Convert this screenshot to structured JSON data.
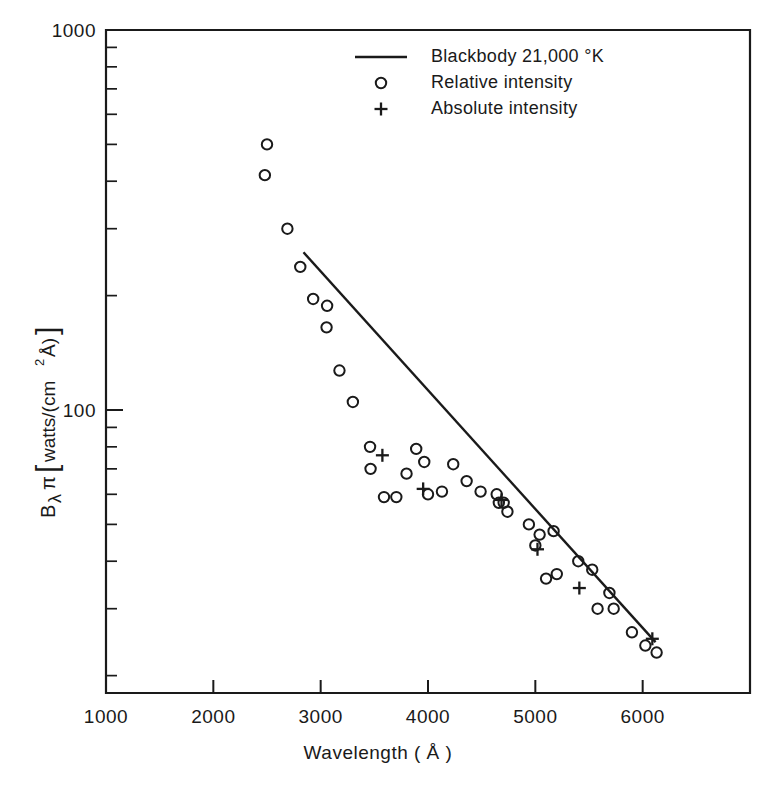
{
  "figure": {
    "background_color": "#ffffff",
    "ink_color": "#1a1a1a"
  },
  "chart_data": {
    "type": "scatter",
    "title": "",
    "xlabel": "Wavelength ( Å )",
    "ylabel": "Bλπ [watts/(cm²Å)]",
    "ylabel_parts": {
      "b": "B",
      "lambda": "λ",
      "pi": "π",
      "bracket_open": "[",
      "watts": "watts/(cm",
      "exp": "2",
      "angstrom": "Å)",
      "bracket_close": "]"
    },
    "xscale": "linear",
    "yscale": "log",
    "xlim": [
      1000,
      7000
    ],
    "ylim": [
      18,
      1000
    ],
    "xticks": [
      1000,
      2000,
      3000,
      4000,
      5000,
      6000,
      7000
    ],
    "xtick_labels": [
      "1000",
      "2000",
      "3000",
      "4000",
      "5000",
      "6000",
      ""
    ],
    "yticks": [
      1000,
      100
    ],
    "ytick_labels": [
      "1000",
      "100"
    ],
    "y_minor_ticks": [
      900,
      800,
      700,
      600,
      500,
      400,
      300,
      200,
      90,
      80,
      70,
      60,
      50,
      40,
      30,
      20
    ],
    "grid": false,
    "legend_position": "top-center",
    "series": [
      {
        "name": "Blackbody  21,000 °K",
        "marker": "line",
        "temperature_k": 21000,
        "line_endpoints": [
          {
            "x": 2840,
            "y": 260.0
          },
          {
            "x": 6120,
            "y": 24.5
          }
        ]
      },
      {
        "name": "Relative intensity",
        "marker": "circle",
        "points": [
          {
            "x": 2500,
            "y": 500
          },
          {
            "x": 2480,
            "y": 415
          },
          {
            "x": 2690,
            "y": 300
          },
          {
            "x": 2810,
            "y": 238
          },
          {
            "x": 2930,
            "y": 196
          },
          {
            "x": 3060,
            "y": 188
          },
          {
            "x": 3055,
            "y": 165
          },
          {
            "x": 3175,
            "y": 127
          },
          {
            "x": 3300,
            "y": 105
          },
          {
            "x": 3460,
            "y": 80
          },
          {
            "x": 3465,
            "y": 70
          },
          {
            "x": 3800,
            "y": 68
          },
          {
            "x": 3590,
            "y": 59
          },
          {
            "x": 3705,
            "y": 59
          },
          {
            "x": 3890,
            "y": 79
          },
          {
            "x": 3965,
            "y": 73
          },
          {
            "x": 4000,
            "y": 60
          },
          {
            "x": 4235,
            "y": 72
          },
          {
            "x": 4360,
            "y": 65
          },
          {
            "x": 4130,
            "y": 61
          },
          {
            "x": 4490,
            "y": 61
          },
          {
            "x": 4640,
            "y": 60
          },
          {
            "x": 4660,
            "y": 57
          },
          {
            "x": 4705,
            "y": 57
          },
          {
            "x": 4740,
            "y": 54
          },
          {
            "x": 4940,
            "y": 50
          },
          {
            "x": 5040,
            "y": 47
          },
          {
            "x": 5170,
            "y": 48
          },
          {
            "x": 5000,
            "y": 44
          },
          {
            "x": 5400,
            "y": 40
          },
          {
            "x": 5530,
            "y": 38
          },
          {
            "x": 5100,
            "y": 36
          },
          {
            "x": 5200,
            "y": 37
          },
          {
            "x": 5690,
            "y": 33
          },
          {
            "x": 5580,
            "y": 30
          },
          {
            "x": 5730,
            "y": 30
          },
          {
            "x": 5900,
            "y": 26
          },
          {
            "x": 6025,
            "y": 24
          },
          {
            "x": 6130,
            "y": 23
          }
        ]
      },
      {
        "name": "Absolute intensity",
        "marker": "plus",
        "points": [
          {
            "x": 3575,
            "y": 76
          },
          {
            "x": 3955,
            "y": 62
          },
          {
            "x": 4685,
            "y": 58
          },
          {
            "x": 5020,
            "y": 43
          },
          {
            "x": 5410,
            "y": 34
          },
          {
            "x": 6090,
            "y": 25
          }
        ]
      }
    ]
  },
  "legend": {
    "entries": [
      {
        "marker": "line",
        "label": "Blackbody  21,000 °K"
      },
      {
        "marker": "circle",
        "label": "Relative intensity"
      },
      {
        "marker": "plus",
        "label": "Absolute intensity"
      }
    ]
  },
  "axes": {
    "x_tick_labels": [
      "1000",
      "2000",
      "3000",
      "4000",
      "5000",
      "6000"
    ],
    "y_tick_labels": [
      "1000",
      "100"
    ],
    "x_axis_title": "Wavelength ( Å )"
  }
}
